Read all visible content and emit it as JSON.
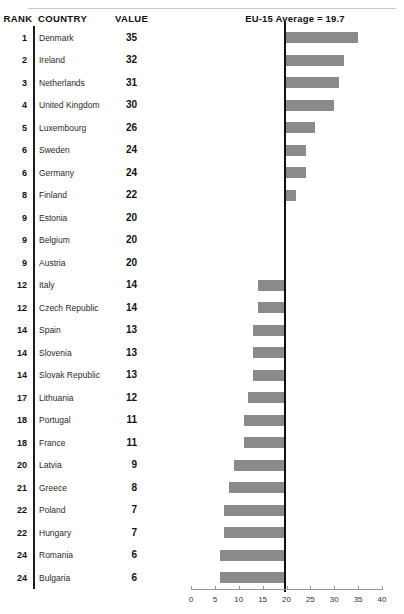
{
  "header": {
    "rank_label": "RANK",
    "country_label": "COUNTRY",
    "value_label": "VALUE",
    "chart_title": "EU-15 Average = 19.7"
  },
  "chart_data": {
    "type": "bar",
    "orientation": "horizontal",
    "title": "EU-15 Average = 19.7",
    "xlabel": "",
    "ylabel": "",
    "xlim": [
      0,
      40
    ],
    "xticks": [
      0,
      5,
      10,
      15,
      20,
      25,
      30,
      35,
      40
    ],
    "grid": false,
    "legend": null,
    "baseline": 19.7,
    "baseline_label": "EU-15 Average = 19.7",
    "bar_color": "#8a8a8a",
    "categories": [
      "Denmark",
      "Ireland",
      "Netherlands",
      "United Kingdom",
      "Luxembourg",
      "Sweden",
      "Germany",
      "Finland",
      "Estonia",
      "Belgium",
      "Austria",
      "Italy",
      "Czech Republic",
      "Spain",
      "Slovenia",
      "Slovak Republic",
      "Lithuania",
      "Portugal",
      "France",
      "Latvia",
      "Greece",
      "Poland",
      "Hungary",
      "Romania",
      "Bulgaria"
    ],
    "values": [
      35,
      32,
      31,
      30,
      26,
      24,
      24,
      22,
      20,
      20,
      20,
      14,
      14,
      13,
      13,
      13,
      12,
      11,
      11,
      9,
      8,
      7,
      7,
      6,
      6
    ],
    "ranks": [
      1,
      2,
      3,
      4,
      5,
      6,
      6,
      8,
      9,
      9,
      9,
      12,
      12,
      14,
      14,
      14,
      17,
      18,
      18,
      20,
      21,
      22,
      22,
      24,
      24
    ]
  },
  "rows": [
    {
      "rank": "1",
      "country": "Denmark",
      "value": "35"
    },
    {
      "rank": "2",
      "country": "Ireland",
      "value": "32"
    },
    {
      "rank": "3",
      "country": "Netherlands",
      "value": "31"
    },
    {
      "rank": "4",
      "country": "United Kingdom",
      "value": "30"
    },
    {
      "rank": "5",
      "country": "Luxembourg",
      "value": "26"
    },
    {
      "rank": "6",
      "country": "Sweden",
      "value": "24"
    },
    {
      "rank": "6",
      "country": "Germany",
      "value": "24"
    },
    {
      "rank": "8",
      "country": "Finland",
      "value": "22"
    },
    {
      "rank": "9",
      "country": "Estonia",
      "value": "20"
    },
    {
      "rank": "9",
      "country": "Belgium",
      "value": "20"
    },
    {
      "rank": "9",
      "country": "Austria",
      "value": "20"
    },
    {
      "rank": "12",
      "country": "Italy",
      "value": "14"
    },
    {
      "rank": "12",
      "country": "Czech Republic",
      "value": "14"
    },
    {
      "rank": "14",
      "country": "Spain",
      "value": "13"
    },
    {
      "rank": "14",
      "country": "Slovenia",
      "value": "13"
    },
    {
      "rank": "14",
      "country": "Slovak Republic",
      "value": "13"
    },
    {
      "rank": "17",
      "country": "Lithuania",
      "value": "12"
    },
    {
      "rank": "18",
      "country": "Portugal",
      "value": "11"
    },
    {
      "rank": "18",
      "country": "France",
      "value": "11"
    },
    {
      "rank": "20",
      "country": "Latvia",
      "value": "9"
    },
    {
      "rank": "21",
      "country": "Greece",
      "value": "8"
    },
    {
      "rank": "22",
      "country": "Poland",
      "value": "7"
    },
    {
      "rank": "22",
      "country": "Hungary",
      "value": "7"
    },
    {
      "rank": "24",
      "country": "Romania",
      "value": "6"
    },
    {
      "rank": "24",
      "country": "Bulgaria",
      "value": "6"
    }
  ],
  "axis": {
    "ticks": [
      "0",
      "5",
      "10",
      "15",
      "20",
      "25",
      "30",
      "35",
      "40"
    ]
  },
  "colors": {
    "bar": "#8a8a8a",
    "baseline": "#111111",
    "axis": "#9a9a9a",
    "rule": "#c9c9c9"
  }
}
